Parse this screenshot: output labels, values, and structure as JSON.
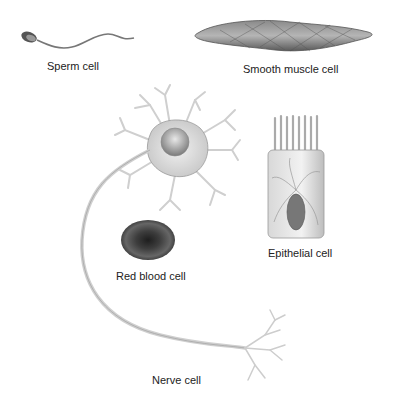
{
  "figure": {
    "cells": [
      {
        "id": "sperm",
        "label": "Sperm cell"
      },
      {
        "id": "smooth-muscle",
        "label": "Smooth muscle cell"
      },
      {
        "id": "nerve",
        "label": "Nerve cell"
      },
      {
        "id": "epithelial",
        "label": "Epithelial cell"
      },
      {
        "id": "red-blood",
        "label": "Red blood cell"
      }
    ]
  },
  "colors": {
    "background": "#ffffff",
    "label_text": "#222222",
    "cell_light": "#e4e4e4",
    "cell_mid": "#9a9a9a",
    "cell_dark": "#3a3a3a"
  }
}
